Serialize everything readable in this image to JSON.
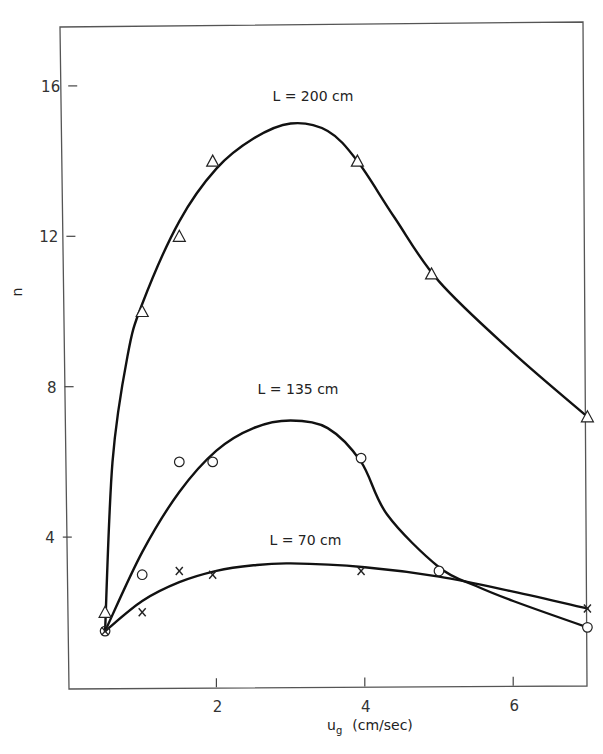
{
  "chart_data": {
    "type": "scatter",
    "title": "",
    "xlabel": "u_g (cm/sec)",
    "xlabel_main": "u",
    "xlabel_sub": "g",
    "xlabel_unit": "(cm/sec)",
    "ylabel": "n",
    "xlim": [
      0,
      7.1
    ],
    "ylim": [
      0,
      18
    ],
    "x_ticks": [
      2,
      4,
      6
    ],
    "y_ticks": [
      4,
      8,
      12,
      16
    ],
    "x_tick_labels": [
      "2",
      "4",
      "6"
    ],
    "y_tick_labels": [
      "4",
      "8",
      "12",
      "16"
    ],
    "grid": false,
    "legend": "none (curves labeled inline)",
    "series": [
      {
        "name": "L = 200 cm",
        "marker": "triangle",
        "points": [
          [
            0.5,
            2.0
          ],
          [
            1.0,
            10.0
          ],
          [
            1.5,
            12.0
          ],
          [
            1.95,
            14.0
          ],
          [
            3.9,
            14.0
          ],
          [
            4.9,
            11.0
          ],
          [
            7.0,
            7.2
          ]
        ],
        "fit_curve": [
          [
            0.5,
            1.5
          ],
          [
            0.6,
            6.0
          ],
          [
            0.8,
            8.8
          ],
          [
            1.0,
            10.2
          ],
          [
            1.5,
            12.4
          ],
          [
            2.0,
            13.8
          ],
          [
            2.5,
            14.6
          ],
          [
            3.0,
            15.0
          ],
          [
            3.5,
            14.8
          ],
          [
            3.9,
            14.0
          ],
          [
            4.4,
            12.5
          ],
          [
            5.0,
            10.8
          ],
          [
            6.0,
            8.9
          ],
          [
            7.0,
            7.2
          ]
        ]
      },
      {
        "name": "L = 135 cm",
        "marker": "circle",
        "points": [
          [
            0.5,
            1.5
          ],
          [
            1.0,
            3.0
          ],
          [
            1.5,
            6.0
          ],
          [
            1.95,
            6.0
          ],
          [
            3.95,
            6.1
          ],
          [
            5.0,
            3.1
          ],
          [
            7.0,
            1.6
          ]
        ],
        "fit_curve": [
          [
            0.5,
            1.5
          ],
          [
            1.0,
            3.6
          ],
          [
            1.5,
            5.2
          ],
          [
            2.0,
            6.3
          ],
          [
            2.5,
            6.9
          ],
          [
            3.0,
            7.1
          ],
          [
            3.5,
            6.9
          ],
          [
            3.95,
            6.0
          ],
          [
            4.3,
            4.6
          ],
          [
            5.0,
            3.2
          ],
          [
            5.5,
            2.7
          ],
          [
            6.0,
            2.3
          ],
          [
            7.0,
            1.6
          ]
        ]
      },
      {
        "name": "L = 70 cm",
        "marker": "x",
        "points": [
          [
            0.5,
            1.5
          ],
          [
            1.0,
            2.0
          ],
          [
            1.5,
            3.1
          ],
          [
            1.95,
            3.0
          ],
          [
            3.95,
            3.1
          ],
          [
            7.0,
            2.1
          ]
        ],
        "fit_curve": [
          [
            0.5,
            1.5
          ],
          [
            1.0,
            2.3
          ],
          [
            1.5,
            2.8
          ],
          [
            2.0,
            3.1
          ],
          [
            2.5,
            3.25
          ],
          [
            3.0,
            3.3
          ],
          [
            4.0,
            3.2
          ],
          [
            5.0,
            2.95
          ],
          [
            6.0,
            2.55
          ],
          [
            7.0,
            2.1
          ]
        ]
      }
    ],
    "annotations": [
      {
        "text": "L = 200 cm",
        "x": 3.3,
        "y": 15.6
      },
      {
        "text": "L = 135 cm",
        "x": 3.1,
        "y": 7.8
      },
      {
        "text": "L = 70 cm",
        "x": 3.2,
        "y": 3.8
      }
    ]
  }
}
